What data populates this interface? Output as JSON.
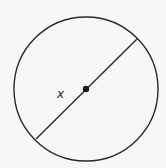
{
  "diagram": {
    "shape": "circle",
    "center": {
      "x": 86,
      "y": 89
    },
    "radius": 72,
    "diameter_line": {
      "x1": 36,
      "y1": 139,
      "x2": 137,
      "y2": 39
    },
    "center_point": true,
    "label": "x",
    "stroke_color": "#2a2a2a",
    "background": "#f7f7f7"
  }
}
